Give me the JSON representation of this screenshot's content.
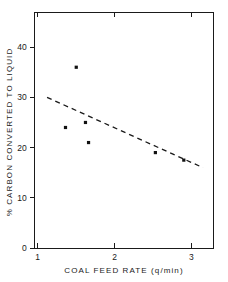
{
  "figure": {
    "background_color": "#ffffff",
    "ink_color": "#1a1a1a",
    "caption": ""
  },
  "chart_data": {
    "type": "scatter",
    "title": "",
    "subtitle": "",
    "xlabel": "COAL FEED RATE (q/min)",
    "ylabel": "% CARBON CONVERTED TO LIQUID",
    "xlim": [
      0.95,
      3.28
    ],
    "ylim": [
      0,
      47
    ],
    "xticks": [
      1,
      2,
      3
    ],
    "xtick_labels": [
      "1",
      "2",
      "3"
    ],
    "yticks": [
      0,
      10,
      20,
      30,
      40
    ],
    "ytick_labels": [
      "0",
      "10",
      "20",
      "30",
      "40"
    ],
    "grid": false,
    "legend": null,
    "legend_position": "none",
    "marker_style": "filled-square",
    "marker_color": "#111111",
    "series": [
      {
        "name": "observations",
        "type": "scatter",
        "points": [
          {
            "x": 1.5,
            "y": 36.0
          },
          {
            "x": 1.36,
            "y": 24.0
          },
          {
            "x": 1.62,
            "y": 25.0
          },
          {
            "x": 1.66,
            "y": 21.0
          },
          {
            "x": 2.53,
            "y": 19.0
          },
          {
            "x": 2.9,
            "y": 17.5
          }
        ]
      },
      {
        "name": "fitted-trend",
        "type": "line",
        "line_style": "dashed",
        "color": "#1a1a1a",
        "points": [
          {
            "x": 1.12,
            "y": 30.0
          },
          {
            "x": 3.15,
            "y": 16.0
          }
        ]
      }
    ],
    "annotations": []
  }
}
